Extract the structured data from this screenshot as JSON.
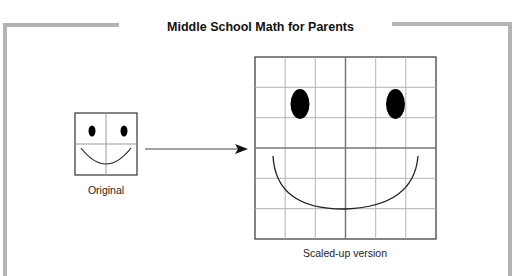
{
  "header": {
    "title": "Middle School Math for Parents"
  },
  "figure": {
    "original": {
      "label": "Original",
      "grid_cells": 2
    },
    "scaled": {
      "label": "Scaled-up version",
      "grid_cells": 6
    },
    "arrow": {
      "direction": "right"
    }
  },
  "colors": {
    "frame": "#b4b4b4",
    "grid": "#9a9a9a",
    "ink": "#000000"
  }
}
